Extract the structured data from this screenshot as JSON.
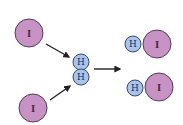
{
  "diagram": {
    "title": "",
    "reactants": [
      {
        "id": "iodine-atom-top",
        "label": "I",
        "cx": 29,
        "cy": 33,
        "r": 14
      },
      {
        "id": "iodine-atom-bottom",
        "label": "I",
        "cx": 33,
        "cy": 108,
        "r": 14
      }
    ],
    "hydrogen_molecule": [
      {
        "id": "hydrogen-atom-top",
        "label": "H",
        "cx": 81,
        "cy": 62,
        "r": 8
      },
      {
        "id": "hydrogen-atom-bottom",
        "label": "H",
        "cx": 81,
        "cy": 77,
        "r": 8
      }
    ],
    "products": [
      {
        "id": "hi-molecule-top",
        "h": {
          "label": "H",
          "cx": 133,
          "cy": 44,
          "r": 8
        },
        "i": {
          "label": "I",
          "cx": 157,
          "cy": 44,
          "r": 14
        }
      },
      {
        "id": "hi-molecule-bottom",
        "h": {
          "label": "H",
          "cx": 135,
          "cy": 88,
          "r": 8
        },
        "i": {
          "label": "I",
          "cx": 159,
          "cy": 87,
          "r": 14
        }
      }
    ],
    "arrows": [
      {
        "id": "arrow-top-left",
        "x1": 46,
        "y1": 44,
        "x2": 69,
        "y2": 57
      },
      {
        "id": "arrow-bottom-left",
        "x1": 50,
        "y1": 100,
        "x2": 70,
        "y2": 86
      },
      {
        "id": "arrow-right",
        "x1": 94,
        "y1": 69,
        "x2": 120,
        "y2": 69
      }
    ],
    "colors": {
      "iodine_fill": "#c792c4",
      "iodine_stroke": "#5a3a5a",
      "hydrogen_fill": "#a9c4ec",
      "hydrogen_stroke": "#3a4a6a",
      "arrow": "#222222"
    }
  }
}
